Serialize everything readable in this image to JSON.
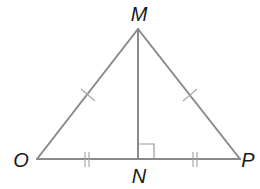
{
  "figure": {
    "type": "isosceles triangle with altitude",
    "stroke_color": "#8a8a8a",
    "label_color": "#1a1a1a",
    "vertices": {
      "M": {
        "label": "M",
        "x": 138,
        "y": 29
      },
      "O": {
        "label": "O",
        "x": 37,
        "y": 159
      },
      "P": {
        "label": "P",
        "x": 240,
        "y": 159
      },
      "N": {
        "label": "N",
        "x": 138,
        "y": 159
      }
    },
    "segments": [
      {
        "from": "O",
        "to": "M",
        "tick_marks": 1
      },
      {
        "from": "M",
        "to": "P",
        "tick_marks": 1
      },
      {
        "from": "O",
        "to": "N",
        "tick_marks": 2
      },
      {
        "from": "N",
        "to": "P",
        "tick_marks": 2
      },
      {
        "from": "M",
        "to": "N",
        "tick_marks": 0
      }
    ],
    "right_angle_at": "N",
    "labels": {
      "M": "M",
      "O": "O",
      "P": "P",
      "N": "N"
    }
  }
}
